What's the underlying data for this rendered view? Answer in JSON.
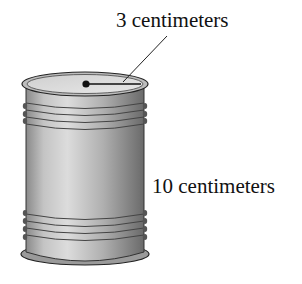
{
  "diagram": {
    "labels": {
      "radius": "3 centimeters",
      "height": "10 centimeters"
    },
    "colors": {
      "body_light": "#e6e6e6",
      "body_dark": "#6f6f6f",
      "outline": "#222222",
      "background": "#ffffff"
    }
  }
}
